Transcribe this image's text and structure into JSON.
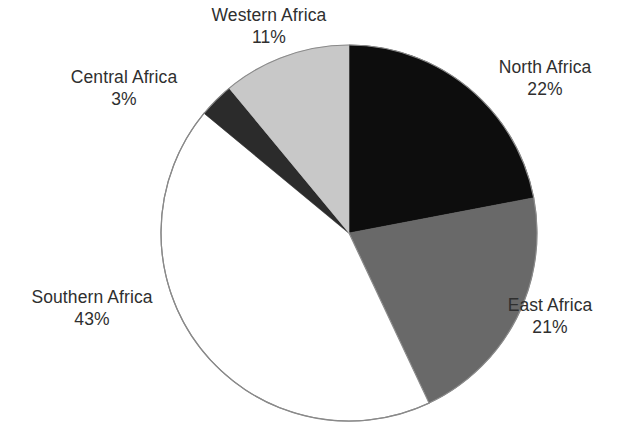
{
  "chart_data": {
    "type": "pie",
    "title": "",
    "subtitle": "",
    "xlabel": "",
    "ylabel": "",
    "legend": "none",
    "grid": false,
    "start_angle_deg": 0,
    "direction": "clockwise",
    "units": "%",
    "categories": [
      "North Africa",
      "East Africa",
      "Southern Africa",
      "Central Africa",
      "Western Africa"
    ],
    "values": [
      22,
      21,
      43,
      3,
      11
    ],
    "labels": [
      "22%",
      "21%",
      "43%",
      "3%",
      "11%"
    ],
    "colors": [
      "#0d0d0d",
      "#696969",
      "#ffffff",
      "#2b2b2b",
      "#c8c8c8"
    ],
    "slices": [
      {
        "name": "North Africa",
        "value": 22,
        "value_label": "22%",
        "color": "#0d0d0d",
        "start_deg": 0,
        "end_deg": 79.2
      },
      {
        "name": "East Africa",
        "value": 21,
        "value_label": "21%",
        "color": "#696969",
        "start_deg": 79.2,
        "end_deg": 154.8
      },
      {
        "name": "Southern Africa",
        "value": 43,
        "value_label": "43%",
        "color": "#ffffff",
        "start_deg": 154.8,
        "end_deg": 309.6
      },
      {
        "name": "Central Africa",
        "value": 3,
        "value_label": "3%",
        "color": "#2b2b2b",
        "start_deg": 309.6,
        "end_deg": 320.4
      },
      {
        "name": "Western Africa",
        "value": 11,
        "value_label": "11%",
        "color": "#c8c8c8",
        "start_deg": 320.4,
        "end_deg": 360
      }
    ]
  },
  "labels": {
    "western": {
      "name": "Western Africa",
      "value": "11%"
    },
    "central": {
      "name": "Central Africa",
      "value": "3%"
    },
    "north": {
      "name": "North Africa",
      "value": "22%"
    },
    "east": {
      "name": "East Africa",
      "value": "21%"
    },
    "southern": {
      "name": "Southern Africa",
      "value": "43%"
    }
  },
  "style": {
    "background": "#ffffff",
    "text_color": "#2f2f2f",
    "outline_color": "#8a8a8a"
  }
}
